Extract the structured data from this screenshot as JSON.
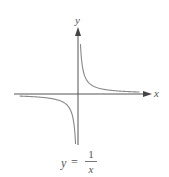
{
  "chart_data": {
    "type": "line",
    "xlabel": "x",
    "ylabel": "y",
    "function": "y = 1/x",
    "grid": false,
    "series": [
      {
        "name": "positive branch",
        "x": [
          0.2,
          0.3,
          0.5,
          1,
          2,
          3,
          4,
          5
        ],
        "values": [
          5,
          3.33,
          2,
          1,
          0.5,
          0.33,
          0.25,
          0.2
        ]
      },
      {
        "name": "negative branch",
        "x": [
          -5,
          -4,
          -3,
          -2,
          -1,
          -0.5,
          -0.3,
          -0.2
        ],
        "values": [
          -0.2,
          -0.25,
          -0.33,
          -0.5,
          -1,
          -2,
          -3.33,
          -5
        ]
      }
    ]
  },
  "labels": {
    "x_axis": "x",
    "y_axis": "y",
    "equation_lhs": "y",
    "equation_eq": "=",
    "equation_num": "1",
    "equation_den": "x"
  },
  "colors": {
    "axis": "#555555",
    "curve": "#888888"
  }
}
